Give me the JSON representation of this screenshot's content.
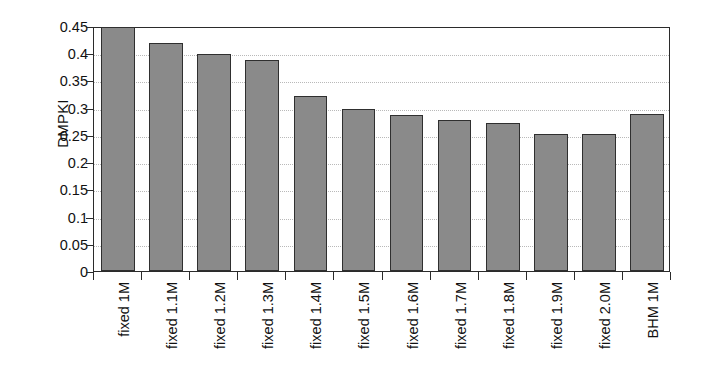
{
  "chart_data": {
    "type": "bar",
    "title": "",
    "xlabel": "",
    "ylabel": "DMPKI",
    "ylim": [
      0,
      0.45
    ],
    "grid": true,
    "legend": false,
    "categories": [
      "fixed 1M",
      "fixed 1.1M",
      "fixed 1.2M",
      "fixed 1.3M",
      "fixed 1.4M",
      "fixed 1.5M",
      "fixed 1.6M",
      "fixed 1.7M",
      "fixed 1.8M",
      "fixed 1.9M",
      "fixed 2.0M",
      "BHM 1M"
    ],
    "values": [
      0.448,
      0.418,
      0.398,
      0.387,
      0.321,
      0.297,
      0.287,
      0.277,
      0.271,
      0.251,
      0.251,
      0.288
    ],
    "y_ticks": [
      0.45,
      0.4,
      0.35,
      0.3,
      0.25,
      0.2,
      0.15,
      0.1,
      0.05,
      0
    ],
    "y_tick_labels": [
      "0.45",
      "0.4",
      "0.35",
      "0.3",
      "0.25",
      "0.2",
      "0.15",
      "0.1",
      "0.05",
      "0"
    ],
    "bar_color": "#8a8a8a",
    "bar_edge_color": "#2f2f2f",
    "axis_color": "#2b2b2b",
    "gridline_color": "#b9b9b9"
  }
}
